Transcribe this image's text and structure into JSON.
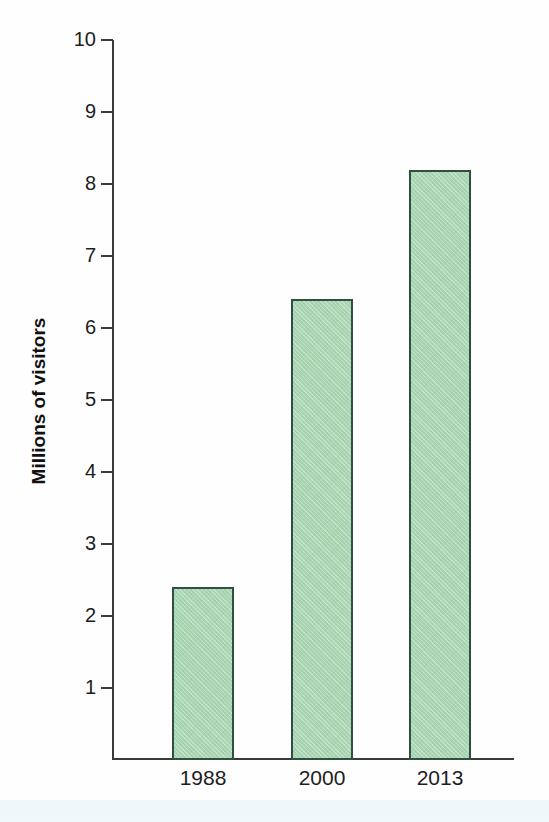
{
  "chart_data": {
    "type": "bar",
    "title": "",
    "subtitle": "",
    "xlabel": "",
    "ylabel": "Millions of visitors",
    "categories": [
      "1988",
      "2000",
      "2013"
    ],
    "values": [
      2.4,
      6.4,
      8.2
    ],
    "ylim": [
      0,
      10
    ],
    "ytick_labels": [
      "10",
      "9",
      "8",
      "7",
      "6",
      "5",
      "4",
      "3",
      "2",
      "1"
    ],
    "ytick_values": [
      10,
      9,
      8,
      7,
      6,
      5,
      4,
      3,
      2,
      1
    ],
    "grid": false,
    "legend": null,
    "series": [
      {
        "name": "Millions of visitors",
        "values": [
          2.4,
          6.4,
          8.2
        ]
      }
    ],
    "colors": {
      "bar_fill": "#a9d6b2",
      "bar_border": "#2f4f43",
      "axis": "#3a3a3a",
      "text": "#1d1d1d",
      "background": "#fefefe"
    }
  },
  "axis": {
    "y_title": "Millions of visitors",
    "ticks": [
      {
        "label": "10",
        "value": 10
      },
      {
        "label": "9",
        "value": 9
      },
      {
        "label": "8",
        "value": 8
      },
      {
        "label": "7",
        "value": 7
      },
      {
        "label": "6",
        "value": 6
      },
      {
        "label": "5",
        "value": 5
      },
      {
        "label": "4",
        "value": 4
      },
      {
        "label": "3",
        "value": 3
      },
      {
        "label": "2",
        "value": 2
      },
      {
        "label": "1",
        "value": 1
      }
    ]
  },
  "bars": [
    {
      "category": "1988",
      "value": 2.4
    },
    {
      "category": "2000",
      "value": 6.4
    },
    {
      "category": "2013",
      "value": 8.2
    }
  ]
}
